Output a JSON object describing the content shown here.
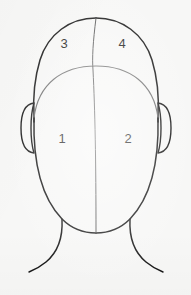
{
  "figure": {
    "view": "anterior",
    "line_color": "#1a1a1a",
    "secondary_line_color": "#6e6e6e",
    "background_color": "#f7f7f6",
    "label_color": "#1c1c1c",
    "regions": [
      {
        "number": "1",
        "name": "lower-left-region",
        "position": "lower left"
      },
      {
        "number": "2",
        "name": "lower-right-region",
        "position": "lower right"
      },
      {
        "number": "3",
        "name": "upper-left-region",
        "position": "upper left"
      },
      {
        "number": "4",
        "name": "upper-right-region",
        "position": "upper right"
      }
    ],
    "parts": [
      {
        "name": "head-outline"
      },
      {
        "name": "hairline-arc"
      },
      {
        "name": "midline"
      },
      {
        "name": "left-ear"
      },
      {
        "name": "right-ear"
      },
      {
        "name": "neck-left"
      },
      {
        "name": "neck-right"
      },
      {
        "name": "shoulder-left"
      },
      {
        "name": "shoulder-right"
      }
    ]
  }
}
